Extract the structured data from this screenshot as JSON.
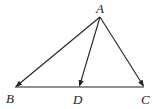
{
  "diagram": {
    "type": "geometry-triangle-vectors",
    "points": {
      "A": {
        "label": "A",
        "x": 100,
        "y": 17
      },
      "B": {
        "label": "B",
        "x": 15,
        "y": 87
      },
      "D": {
        "label": "D",
        "x": 79,
        "y": 87
      },
      "C": {
        "label": "C",
        "x": 144,
        "y": 87
      }
    },
    "labels": {
      "A": "A",
      "B": "B",
      "D": "D",
      "C": "C"
    },
    "vectors": [
      {
        "from": "A",
        "to": "B"
      },
      {
        "from": "A",
        "to": "D"
      },
      {
        "from": "A",
        "to": "C"
      }
    ],
    "segments": [
      {
        "from": "B",
        "to": "C"
      }
    ],
    "colors": {
      "stroke": "#222222",
      "background": "#ffffff"
    }
  }
}
